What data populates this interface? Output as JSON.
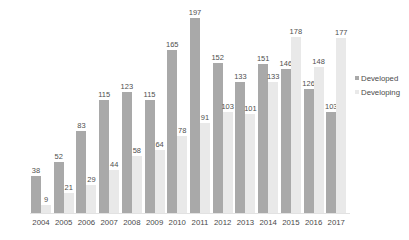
{
  "chart_data": {
    "type": "bar",
    "title": "",
    "subtitle": "",
    "xlabel": "",
    "ylabel": "",
    "ylim": [
      0,
      197
    ],
    "grid": false,
    "legend_position": "right",
    "categories": [
      "2004",
      "2005",
      "2006",
      "2007",
      "2008",
      "2009",
      "2010",
      "2011",
      "2012",
      "2013",
      "2014",
      "2015",
      "2016",
      "2017"
    ],
    "series": [
      {
        "name": "Developed",
        "color": "#a9a9a9",
        "values": [
          38,
          52,
          83,
          115,
          123,
          115,
          165,
          197,
          152,
          133,
          151,
          146,
          126,
          103
        ]
      },
      {
        "name": "Developing",
        "color": "#e9e9e9",
        "values": [
          9,
          21,
          29,
          44,
          58,
          64,
          78,
          91,
          103,
          101,
          133,
          178,
          148,
          177
        ]
      }
    ]
  },
  "legend": {
    "items": [
      {
        "label": "Developed",
        "color": "#a9a9a9"
      },
      {
        "label": "Developing",
        "color": "#e9e9e9"
      }
    ]
  }
}
